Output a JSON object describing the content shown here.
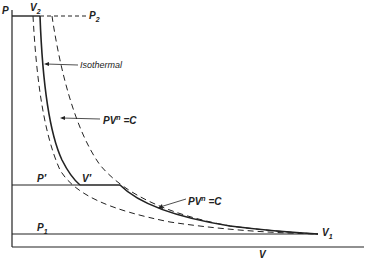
{
  "diagram": {
    "type": "pressure-volume diagram",
    "axes": {
      "y_label": "P",
      "x_label": "V"
    },
    "labels": {
      "v2": "V",
      "v2_sub": "2",
      "p2": "P",
      "p2_sub": "2",
      "isothermal": "Isothermal",
      "pvn_upper": "PV",
      "pvn_upper_sup": "n",
      "pvn_upper_rhs": "=C",
      "pvn_lower": "PV",
      "pvn_lower_sup": "n",
      "pvn_lower_rhs": "=C",
      "p_prime": "P",
      "p_prime_mark": "′",
      "v_prime": "V",
      "v_prime_mark": "′",
      "p1": "P",
      "p1_sub": "1",
      "v1": "V",
      "v1_sub": "1"
    },
    "curves": [
      {
        "name": "isothermal",
        "style": "dashed"
      },
      {
        "name": "polytropic-two-stage",
        "style": "solid"
      },
      {
        "name": "polytropic-single-stage",
        "style": "dashed"
      }
    ],
    "colors": {
      "line": "#222222",
      "background": "#ffffff"
    }
  }
}
